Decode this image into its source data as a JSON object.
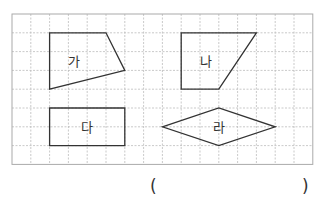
{
  "grid": {
    "cols": 16,
    "rows": 8,
    "cell": 18.8,
    "origin": [
      12,
      14
    ],
    "line_color": "#bbbbbb",
    "border_color": "#aaaaaa"
  },
  "shapes": [
    {
      "id": "ga",
      "label": "가",
      "type": "quadrilateral",
      "points": [
        [
          2,
          1
        ],
        [
          5,
          1
        ],
        [
          6,
          3
        ],
        [
          2,
          4
        ]
      ],
      "label_pos": [
        3.3,
        2.6
      ]
    },
    {
      "id": "na",
      "label": "나",
      "type": "trapezoid",
      "points": [
        [
          9,
          1
        ],
        [
          13,
          1
        ],
        [
          11,
          4
        ],
        [
          9,
          4
        ]
      ],
      "label_pos": [
        10.3,
        2.6
      ]
    },
    {
      "id": "da",
      "label": "다",
      "type": "rectangle",
      "points": [
        [
          2,
          5
        ],
        [
          6,
          5
        ],
        [
          6,
          7
        ],
        [
          2,
          7
        ]
      ],
      "label_pos": [
        4,
        6.1
      ]
    },
    {
      "id": "ra",
      "label": "라",
      "type": "rhombus",
      "points": [
        [
          8,
          6
        ],
        [
          11,
          5
        ],
        [
          14,
          6
        ],
        [
          11,
          7
        ]
      ],
      "label_pos": [
        11,
        6.1
      ]
    }
  ],
  "answer": {
    "open_paren": "(",
    "close_paren": ")",
    "value": ""
  }
}
